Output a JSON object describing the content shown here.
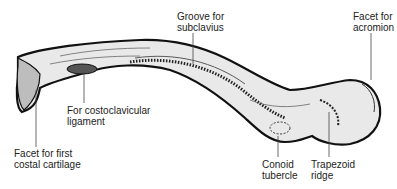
{
  "figure": {
    "labels": [
      {
        "id": "groove-subclavius",
        "line1": "Groove for",
        "line2": "subclavius"
      },
      {
        "id": "facet-acromion",
        "line1": "Facet for",
        "line2": "acromion"
      },
      {
        "id": "costoclavicular-ligament",
        "line1": "For costoclavicular",
        "line2": "ligament"
      },
      {
        "id": "facet-first-costal",
        "line1": "Facet for first",
        "line2": "costal cartilage"
      },
      {
        "id": "conoid-tubercle",
        "line1": "Conoid",
        "line2": "tubercle"
      },
      {
        "id": "trapezoid-ridge",
        "line1": "Trapezoid",
        "line2": "ridge"
      }
    ],
    "colors": {
      "bone_fill": "#e9e9e9",
      "outline": "#111111",
      "text": "#222222",
      "leader": "#444444"
    }
  }
}
